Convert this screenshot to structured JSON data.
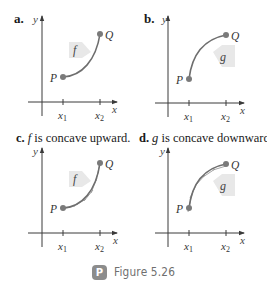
{
  "figure": {
    "caption": "Figure 5.26",
    "badge_letter": "P"
  },
  "colors": {
    "curve": "#6e6e6e",
    "point": "#7a7a7a",
    "axis": "#3a3a3a",
    "tag_fill": "#e6e6e6",
    "badge": "#8c8c8c"
  },
  "panels": [
    {
      "id": "a",
      "label": "a.",
      "title_rest": "",
      "function": "f",
      "shape": "concave-up",
      "axis_x": "x",
      "axis_y": "y",
      "point_start": "P",
      "point_end": "Q",
      "tick_1": "x",
      "tick_1_sub": "1",
      "tick_2": "x",
      "tick_2_sub": "2"
    },
    {
      "id": "b",
      "label": "b.",
      "title_rest": "",
      "function": "g",
      "shape": "concave-down",
      "axis_x": "x",
      "axis_y": "y",
      "point_start": "P",
      "point_end": "Q",
      "tick_1": "x",
      "tick_1_sub": "1",
      "tick_2": "x",
      "tick_2_sub": "2"
    },
    {
      "id": "c",
      "label": "c.",
      "title_fn": "f",
      "title_rest": " is concave upward.",
      "function": "f",
      "shape": "concave-up-with-tangents",
      "axis_x": "x",
      "axis_y": "y",
      "point_start": "P",
      "point_end": "Q",
      "tick_1": "x",
      "tick_1_sub": "1",
      "tick_2": "x",
      "tick_2_sub": "2"
    },
    {
      "id": "d",
      "label": "d.",
      "title_fn": "g",
      "title_rest": " is concave downward.",
      "function": "g",
      "shape": "concave-down-with-tangents",
      "axis_x": "x",
      "axis_y": "y",
      "point_start": "P",
      "point_end": "Q",
      "tick_1": "x",
      "tick_1_sub": "1",
      "tick_2": "x",
      "tick_2_sub": "2"
    }
  ]
}
